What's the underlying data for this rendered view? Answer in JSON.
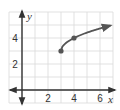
{
  "chart_data": {
    "type": "line",
    "title": "",
    "xlabel": "x",
    "ylabel": "y",
    "xlim": [
      -1,
      7
    ],
    "ylim": [
      -1,
      6
    ],
    "grid": true,
    "x_ticks": [
      2,
      4,
      6
    ],
    "y_ticks": [
      2,
      4
    ],
    "x_tick_labels": [
      "2",
      "4",
      "6"
    ],
    "y_tick_labels": [
      "2",
      "4"
    ],
    "series": [
      {
        "name": "curve",
        "function": "y = sqrt(x - 3) + 3",
        "marked_points": [
          [
            3,
            3
          ],
          [
            4,
            4
          ]
        ],
        "x": [
          3,
          3.25,
          3.5,
          4,
          4.5,
          5,
          5.5,
          6,
          6.5,
          6.8
        ],
        "values": [
          3,
          3.5,
          3.71,
          4,
          4.22,
          4.41,
          4.58,
          4.73,
          4.87,
          4.95
        ],
        "start": "closed-dot",
        "end": "arrow"
      }
    ],
    "colors": {
      "curve": "#555555",
      "axes": "#333333",
      "grid": "#d9d9d9"
    }
  }
}
